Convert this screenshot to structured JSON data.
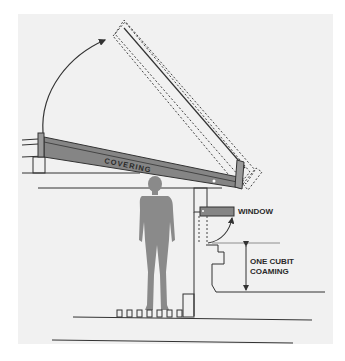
{
  "diagram": {
    "labels": {
      "covering": "COVERING",
      "window": "WINDOW",
      "coaming_line1": "ONE CUBIT",
      "coaming_line2": "COAMING"
    },
    "colors": {
      "background": "#f1f1f1",
      "outer": "#ffffff",
      "covering_fill": "#858585",
      "figure_fill": "#8a8a8a",
      "line": "#333333",
      "label": "#2a2a2a"
    }
  }
}
